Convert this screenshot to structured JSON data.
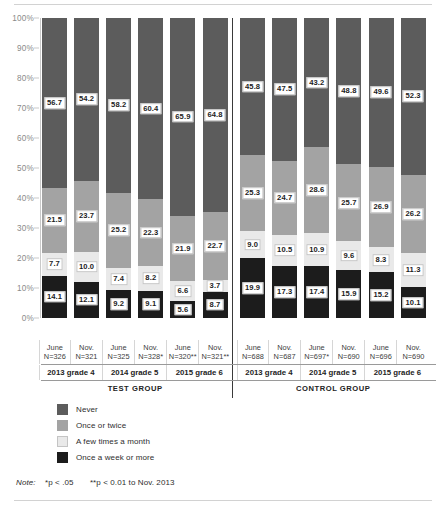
{
  "chart_data": {
    "type": "bar",
    "subtype": "stacked-100-percent",
    "title": "",
    "xlabel": "",
    "ylabel": "",
    "ylim": [
      0,
      100
    ],
    "ytick_labels": [
      "100%",
      "90%",
      "80%",
      "70%",
      "60%",
      "50%",
      "40%",
      "30%",
      "20%",
      "10%",
      "0%"
    ],
    "ytick_values": [
      100,
      90,
      80,
      70,
      60,
      50,
      40,
      30,
      20,
      10,
      0
    ],
    "grid": false,
    "legend_position": "below-left",
    "legend": [
      "Never",
      "Once or twice",
      "A few times a month",
      "Once a week or more"
    ],
    "series": [
      {
        "name": "Never",
        "color": "#5c5c5c",
        "values": [
          56.7,
          54.2,
          58.2,
          60.4,
          65.9,
          64.8,
          45.8,
          47.5,
          43.2,
          48.8,
          49.6,
          52.3
        ]
      },
      {
        "name": "Once or twice",
        "color": "#a3a3a3",
        "values": [
          21.5,
          23.7,
          25.2,
          22.3,
          21.9,
          22.7,
          25.3,
          24.7,
          28.6,
          25.7,
          26.9,
          26.2
        ]
      },
      {
        "name": "A few times a month",
        "color": "#e9e9e9",
        "values": [
          7.7,
          10.0,
          7.4,
          8.2,
          6.6,
          3.7,
          9.0,
          10.5,
          10.9,
          9.6,
          8.3,
          11.3
        ]
      },
      {
        "name": "Once a week or more",
        "color": "#1c1c1c",
        "values": [
          14.1,
          12.1,
          9.2,
          9.1,
          5.6,
          8.7,
          19.9,
          17.3,
          17.4,
          15.9,
          15.2,
          10.1
        ]
      }
    ],
    "categories": [
      {
        "period": "June",
        "n": "N=326"
      },
      {
        "period": "Nov.",
        "n": "N=321"
      },
      {
        "period": "June",
        "n": "N=325"
      },
      {
        "period": "Nov.",
        "n": "N=328*"
      },
      {
        "period": "June",
        "n": "N=320**"
      },
      {
        "period": "Nov.",
        "n": "N=321**"
      },
      {
        "period": "June",
        "n": "N=688"
      },
      {
        "period": "Nov.",
        "n": "N=687"
      },
      {
        "period": "June",
        "n": "N=697*"
      },
      {
        "period": "Nov.",
        "n": "N=690"
      },
      {
        "period": "June",
        "n": "N=696"
      },
      {
        "period": "Nov.",
        "n": "N=690"
      }
    ],
    "grade_groups": [
      "2013 grade 4",
      "2014 grade 5",
      "2015 grade 6",
      "2013 grade 4",
      "2014 grade 5",
      "2015 grade 6"
    ],
    "super_groups": [
      "TEST GROUP",
      "CONTROL GROUP"
    ],
    "annotations": {
      "note_prefix": "Note:",
      "note_p05": "*p < .05",
      "note_p01": "**p < 0.01 to Nov. 2013"
    }
  }
}
